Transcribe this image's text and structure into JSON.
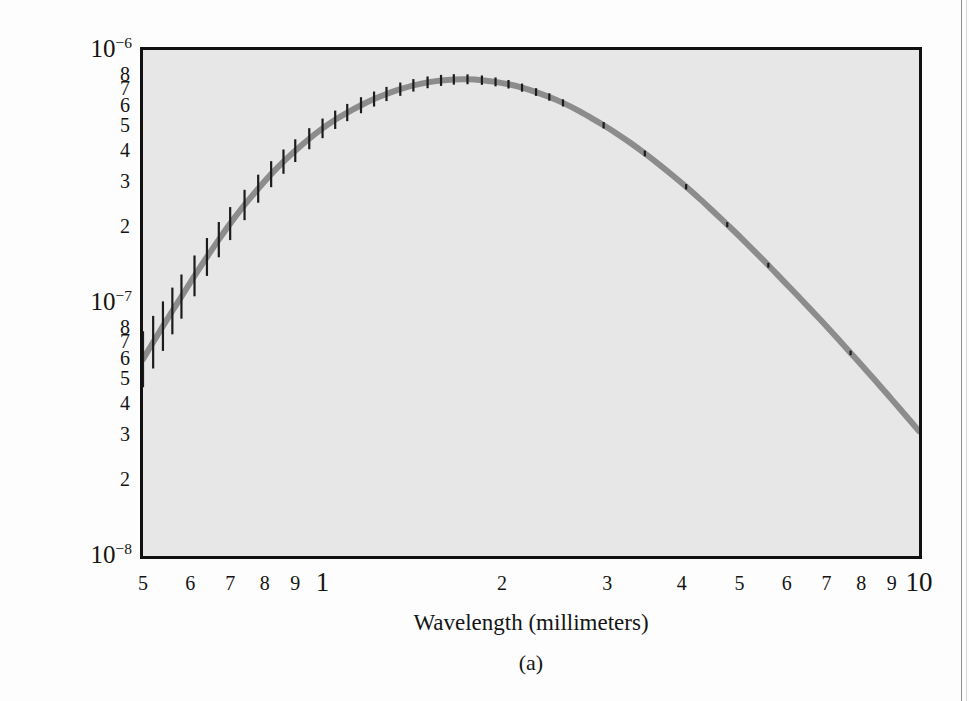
{
  "figure": {
    "panel_label": "(a)",
    "background_color": "#e7e7e7",
    "frame_color": "#111111",
    "curve_color": "#8c8c8c",
    "errorbar_color": "#1b1b1b"
  },
  "chart_data": {
    "type": "line",
    "title": "",
    "subtitle": "",
    "xlabel": "Wavelength (millimeters)",
    "ylabel": "Intensity (W/m2/per unit of sky)",
    "ylabel_html": "Intensity (W/m<sup>2</sup>/per unit of sky)",
    "xscale": "log",
    "yscale": "log",
    "xlim": [
      0.5,
      10
    ],
    "ylim": [
      1e-08,
      1e-06
    ],
    "grid": false,
    "legend": "none",
    "xticklabels": [
      "5",
      "6",
      "7",
      "8",
      "9",
      "1",
      "2",
      "3",
      "4",
      "5",
      "6",
      "7",
      "8",
      "9",
      "10"
    ],
    "xtickvalues": [
      0.5,
      0.6,
      0.7,
      0.8,
      0.9,
      1,
      2,
      3,
      4,
      5,
      6,
      7,
      8,
      9,
      10
    ],
    "xtick_decades": [
      1,
      10
    ],
    "yticklabels": [
      "10-6",
      "8",
      "7",
      "6",
      "5",
      "4",
      "3",
      "2",
      "10-7",
      "8",
      "7",
      "6",
      "5",
      "4",
      "3",
      "2",
      "10-8"
    ],
    "ytickvalues": [
      1e-06,
      8e-07,
      7e-07,
      6e-07,
      5e-07,
      4e-07,
      3e-07,
      2e-07,
      1e-07,
      8e-08,
      7e-08,
      6e-08,
      5e-08,
      4e-08,
      3e-08,
      2e-08,
      1e-08
    ],
    "ytick_decade_labels": [
      "10^-6",
      "10^-7",
      "10^-8"
    ],
    "ytick_minor_labels_upper": [
      "8",
      "7",
      "6",
      "5",
      "4",
      "3",
      "2"
    ],
    "ytick_minor_labels_lower": [
      "8",
      "7",
      "6",
      "5",
      "4",
      "3",
      "2"
    ],
    "series": [
      {
        "name": "CMB blackbody spectrum",
        "style": "thick-gray-line-with-error-bars",
        "x": [
          0.5,
          0.52,
          0.54,
          0.56,
          0.58,
          0.61,
          0.64,
          0.67,
          0.7,
          0.74,
          0.78,
          0.82,
          0.86,
          0.9,
          0.95,
          1.0,
          1.05,
          1.1,
          1.16,
          1.22,
          1.28,
          1.35,
          1.42,
          1.5,
          1.58,
          1.66,
          1.75,
          1.85,
          1.95,
          2.05,
          2.16,
          2.28,
          2.4,
          2.53,
          2.67,
          2.81,
          2.96,
          3.12,
          3.29,
          3.47,
          3.66,
          3.86,
          4.07,
          4.29,
          4.52,
          4.77,
          5.03,
          5.3,
          5.59,
          5.89,
          6.21,
          6.55,
          6.91,
          7.28,
          7.68,
          8.1,
          8.54,
          9.0,
          9.49,
          10.0
        ],
        "y": [
          6e-08,
          7e-08,
          8.1e-08,
          9.3e-08,
          1.06e-07,
          1.28e-07,
          1.52e-07,
          1.78e-07,
          2.06e-07,
          2.44e-07,
          2.83e-07,
          3.23e-07,
          3.62e-07,
          4e-07,
          4.46e-07,
          4.9e-07,
          5.3e-07,
          5.66e-07,
          6.05e-07,
          6.4e-07,
          6.7e-07,
          7e-07,
          7.25e-07,
          7.45e-07,
          7.58e-07,
          7.65e-07,
          7.66e-07,
          7.6e-07,
          7.48e-07,
          7.32e-07,
          7.1e-07,
          6.82e-07,
          6.52e-07,
          6.18e-07,
          5.8e-07,
          5.42e-07,
          5.04e-07,
          4.66e-07,
          4.28e-07,
          3.9e-07,
          3.54e-07,
          3.2e-07,
          2.88e-07,
          2.58e-07,
          2.3e-07,
          2.04e-07,
          1.81e-07,
          1.6e-07,
          1.41e-07,
          1.24e-07,
          1.09e-07,
          9.55e-08,
          8.35e-08,
          7.3e-08,
          6.35e-08,
          5.52e-08,
          4.8e-08,
          4.16e-08,
          3.6e-08,
          3.12e-08
        ],
        "error_bars": "vertical, large at short wavelengths, shrinking toward long wavelengths",
        "peak_x": 1.75,
        "peak_y": 7.66e-07
      }
    ]
  }
}
